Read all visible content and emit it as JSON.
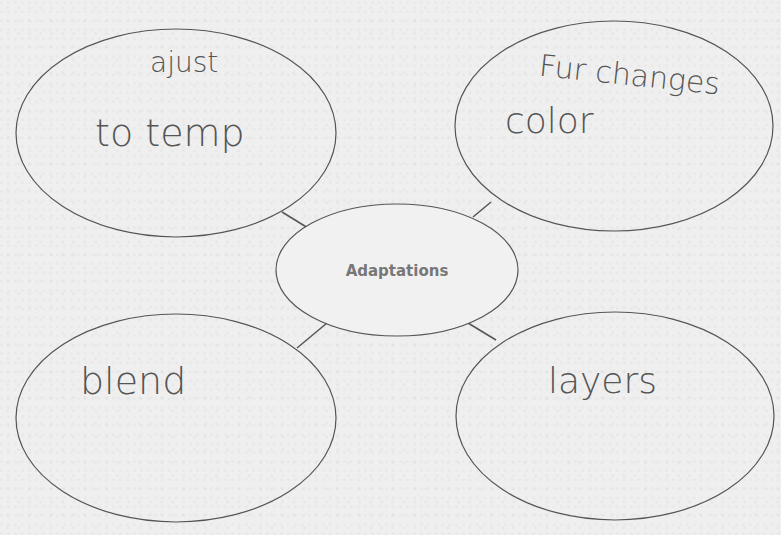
{
  "diagram": {
    "type": "bubble-map",
    "center": {
      "label": "Adaptations"
    },
    "bubbles": [
      {
        "position": "top-left",
        "lines": [
          "ajust",
          "to temp"
        ]
      },
      {
        "position": "top-right",
        "lines": [
          "Fur changes",
          "color"
        ]
      },
      {
        "position": "bottom-left",
        "lines": [
          "blend"
        ]
      },
      {
        "position": "bottom-right",
        "lines": [
          "layers"
        ]
      }
    ],
    "colors": {
      "stroke": "#555555",
      "background": "#efefef",
      "handwriting": "#555555",
      "center_text": "#777777"
    }
  }
}
